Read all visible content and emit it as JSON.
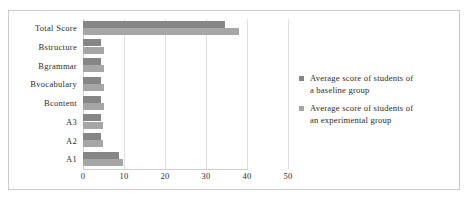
{
  "chart_data": {
    "type": "bar",
    "orientation": "horizontal",
    "title": "",
    "xlabel": "",
    "ylabel": "",
    "categories": [
      "A1",
      "A2",
      "A3",
      "Bcontent",
      "Bvocabulary",
      "Bgrammar",
      "Bstructure",
      "Total Score"
    ],
    "categories_top_to_bottom": [
      "Total Score",
      "Bstructure",
      "Bgrammar",
      "Bvocabulary",
      "Bcontent",
      "A3",
      "A2",
      "A1"
    ],
    "series": [
      {
        "name": "Average score of students of a baseline group",
        "color": "#868686",
        "values_top_to_bottom": [
          34.6,
          4.3,
          4.3,
          4.4,
          4.3,
          4.4,
          4.4,
          8.8
        ]
      },
      {
        "name": "Average score of students of an experimental group",
        "color": "#a6a6a6",
        "values_top_to_bottom": [
          38.0,
          5.0,
          5.0,
          5.0,
          5.0,
          4.8,
          4.8,
          9.8
        ]
      }
    ],
    "xlim": [
      0,
      50
    ],
    "xticks": [
      0,
      10,
      20,
      30,
      40,
      50
    ],
    "xtick_labels": [
      "0",
      "10",
      "20",
      "30",
      "40",
      "50"
    ],
    "grid": true,
    "grid_axis": "x",
    "legend_position": "right"
  },
  "legend": {
    "entries": [
      {
        "swatch": "baseline",
        "line1": "Average score of students of",
        "line2": "a baseline group"
      },
      {
        "swatch": "experimental",
        "line1": "Average score of students of",
        "line2": "an experimental group"
      }
    ]
  }
}
